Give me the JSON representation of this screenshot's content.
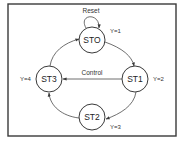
{
  "diagram": {
    "title": "",
    "states": [
      {
        "id": "STO",
        "label": "STO",
        "output": "Y=1"
      },
      {
        "id": "ST1",
        "label": "ST1",
        "output": "Y=2"
      },
      {
        "id": "ST2",
        "label": "ST2",
        "output": "Y=3"
      },
      {
        "id": "ST3",
        "label": "ST3",
        "output": "Y=4"
      }
    ],
    "transitions": [
      {
        "from": "STO",
        "to": "STO",
        "label": "Reset"
      },
      {
        "from": "STO",
        "to": "ST1",
        "label": ""
      },
      {
        "from": "ST1",
        "to": "ST2",
        "label": ""
      },
      {
        "from": "ST1",
        "to": "ST3",
        "label": "Control"
      },
      {
        "from": "ST2",
        "to": "ST3",
        "label": ""
      },
      {
        "from": "ST3",
        "to": "STO",
        "label": ""
      }
    ],
    "colors": {
      "stroke": "#3a3a3a",
      "background": "#ffffff"
    }
  }
}
